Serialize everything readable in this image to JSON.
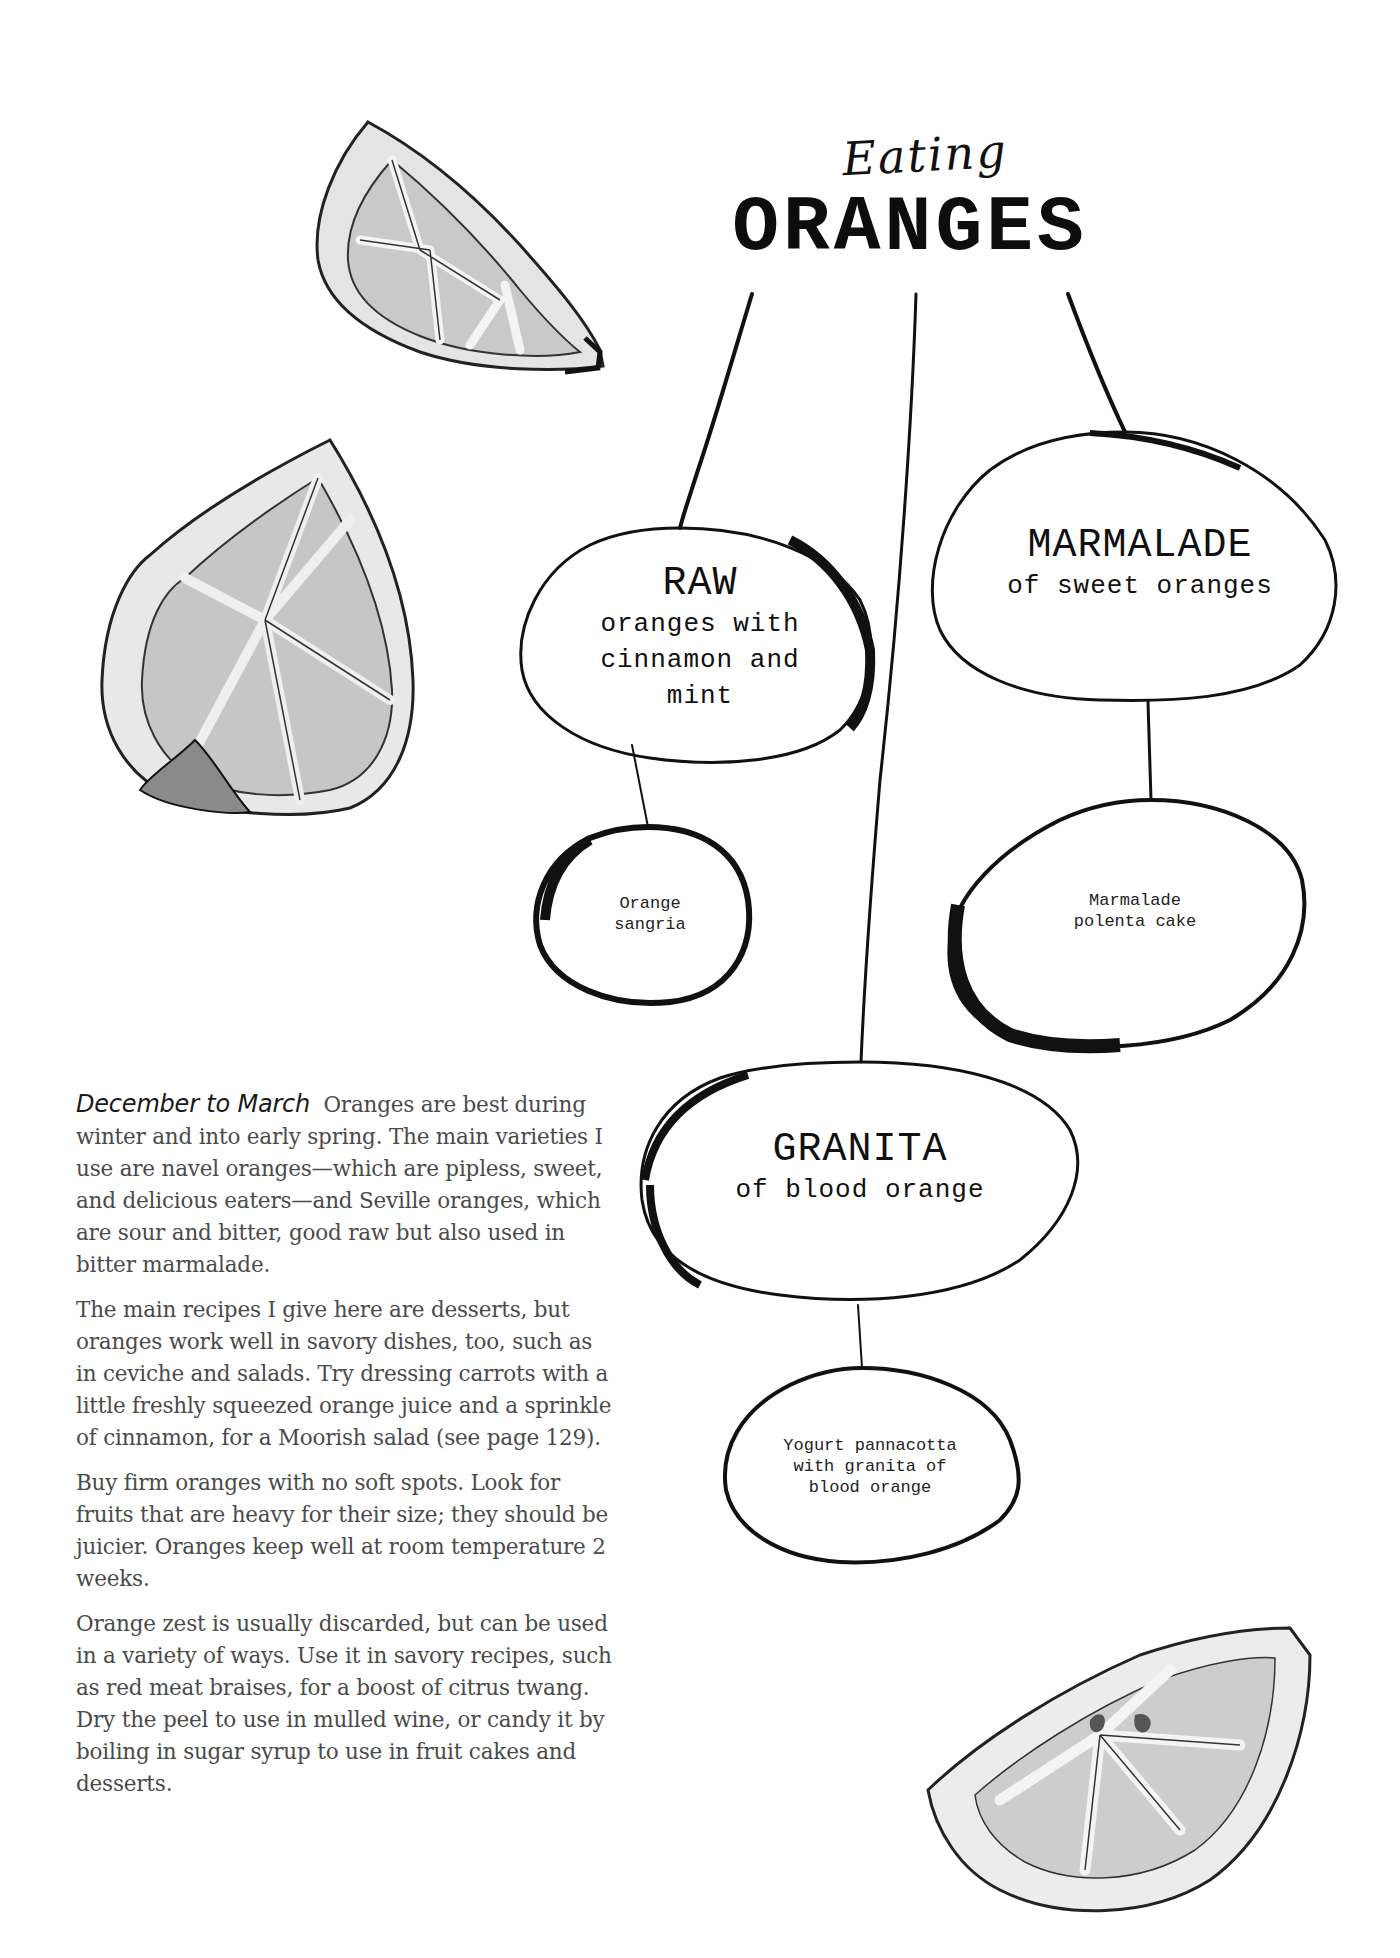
{
  "title": {
    "script": "Eating",
    "main": "ORANGES"
  },
  "nodes": {
    "raw": {
      "heading": "RAW",
      "subtitle": "oranges with cinnamon and mint"
    },
    "marmalade": {
      "heading": "MARMALADE",
      "subtitle": "of sweet oranges"
    },
    "granita": {
      "heading": "GRANITA",
      "subtitle": "of blood orange"
    }
  },
  "leaves": {
    "sangria": {
      "line1": "Orange",
      "line2": "sangria"
    },
    "polenta": {
      "line1": "Marmalade",
      "line2": "polenta cake"
    },
    "pannacotta": {
      "line1": "Yogurt pannacotta",
      "line2": "with granita of",
      "line3": "blood orange"
    }
  },
  "body": {
    "lead": "December to March",
    "paragraphs": [
      "Oranges are best during winter and into early spring. The main varieties I use are navel oranges—which are pipless, sweet, and delicious eaters—and Seville oranges, which are sour and bitter, good raw but also used in bitter marmalade.",
      "The main recipes I give here are desserts, but oranges work well in savory dishes, too, such as in ceviche and salads. Try dressing carrots with a little freshly squeezed orange juice and a sprinkle of cinnamon, for a Moorish salad (see page 129).",
      "Buy firm oranges with no soft spots. Look for fruits that are heavy for their size; they should be juicier. Oranges keep well at room temperature 2 weeks.",
      "Orange zest is usually discarded, but can be used in a variety of ways. Use it in savory recipes, such as red meat braises, for a boost of citrus twang. Dry the peel to use in mulled wine, or candy it by boiling in sugar syrup to use in fruit cakes and desserts."
    ]
  },
  "illustrations": {
    "top_wedge": "orange-wedge-icon",
    "left_half": "orange-half-icon",
    "bottom_wedge": "orange-slice-icon"
  },
  "colors": {
    "ink": "#111111",
    "body_text": "#4a4a4a",
    "fruit_shade": "#cfcfcf",
    "fruit_light": "#e6e6e6"
  }
}
